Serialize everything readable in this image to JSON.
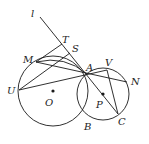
{
  "diagram": {
    "type": "geometry",
    "stroke_color": "#1a1a1a",
    "points": {
      "l": {
        "label": "l",
        "x": 40,
        "y": 17
      },
      "T": {
        "label": "T",
        "x": 62,
        "y": 44
      },
      "S": {
        "label": "S",
        "x": 70,
        "y": 53
      },
      "M": {
        "label": "M",
        "x": 36,
        "y": 62
      },
      "A": {
        "label": "A",
        "x": 87,
        "y": 74
      },
      "V": {
        "label": "V",
        "x": 107,
        "y": 70
      },
      "N": {
        "label": "N",
        "x": 127,
        "y": 82
      },
      "U": {
        "label": "U",
        "x": 19,
        "y": 90
      },
      "O": {
        "label": "O",
        "x": 53,
        "y": 91
      },
      "P": {
        "label": "P",
        "x": 103,
        "y": 94
      },
      "B": {
        "label": "B",
        "x": 87,
        "y": 122
      },
      "C": {
        "label": "C",
        "x": 118,
        "y": 114
      }
    },
    "circles": [
      {
        "name": "circle-O",
        "cx": 53,
        "cy": 91,
        "r": 35
      },
      {
        "name": "circle-P",
        "cx": 103,
        "cy": 94,
        "r": 26
      }
    ],
    "labels": {
      "l": "l",
      "T": "T",
      "S": "S",
      "M": "M",
      "A": "A",
      "V": "V",
      "N": "N",
      "U": "U",
      "O": "O",
      "P": "P",
      "B": "B",
      "C": "C"
    }
  }
}
